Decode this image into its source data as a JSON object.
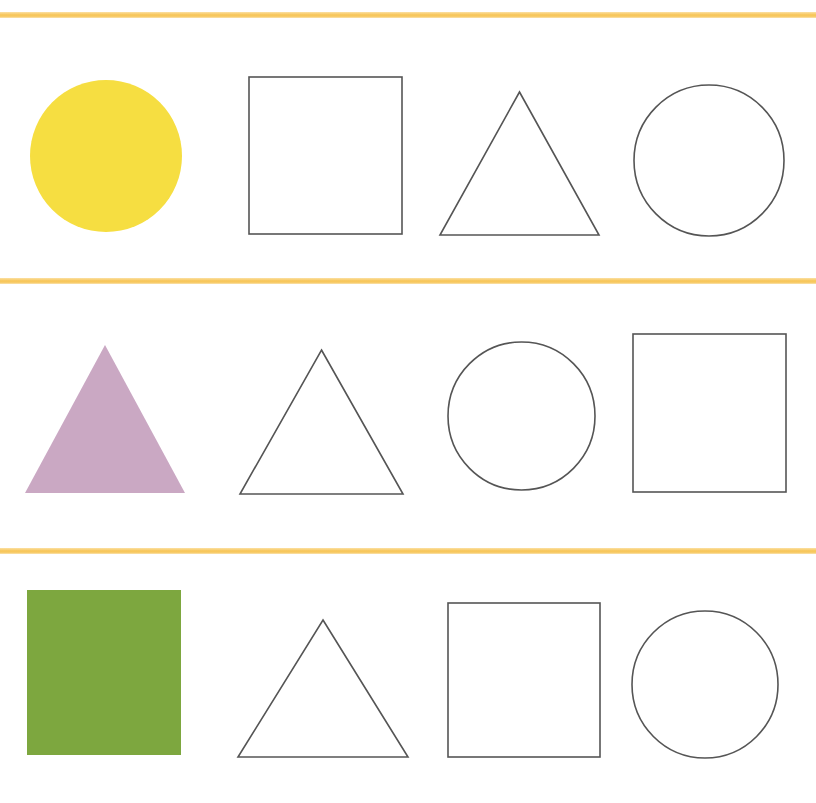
{
  "worksheet": {
    "title": "Shape Pattern Worksheet",
    "background_color": "#ffffff",
    "width": 816,
    "height": 803,
    "divider_color": "#F7C75C",
    "outline_color": "#555555",
    "outline_width": 1.6,
    "dividers": [
      {
        "name": "divider-top",
        "y": 12,
        "thickness": 6
      },
      {
        "name": "divider-middle",
        "y": 278,
        "thickness": 6
      },
      {
        "name": "divider-bottom",
        "y": 548,
        "thickness": 6
      }
    ],
    "rows": [
      {
        "id": "row-1",
        "label": "Row 1",
        "key_shape": "circle",
        "key_color": "#F7DE3C",
        "pattern_sequence": [
          "circle",
          "square",
          "triangle",
          "circle"
        ],
        "shapes": [
          {
            "name": "yellow-circle",
            "type": "circle",
            "fill": "#F7DE3C",
            "stroke": "none",
            "x": 30,
            "y": 80,
            "w": 152,
            "h": 152
          },
          {
            "name": "outline-square-1",
            "type": "square",
            "fill": "none",
            "stroke": "#555555",
            "x": 249,
            "y": 77,
            "w": 153,
            "h": 157
          },
          {
            "name": "outline-triangle-1",
            "type": "triangle",
            "fill": "none",
            "stroke": "#555555",
            "x": 440,
            "y": 92,
            "w": 159,
            "h": 143
          },
          {
            "name": "outline-circle-1",
            "type": "circle",
            "fill": "none",
            "stroke": "#555555",
            "x": 634,
            "y": 85,
            "w": 150,
            "h": 151
          }
        ]
      },
      {
        "id": "row-2",
        "label": "Row 2",
        "key_shape": "triangle",
        "key_color": "#CBA8C4",
        "pattern_sequence": [
          "triangle",
          "triangle",
          "circle",
          "square"
        ],
        "shapes": [
          {
            "name": "purple-triangle",
            "type": "triangle",
            "fill": "#CBA8C4",
            "stroke": "none",
            "x": 25,
            "y": 345,
            "w": 160,
            "h": 148
          },
          {
            "name": "outline-triangle-2",
            "type": "triangle",
            "fill": "none",
            "stroke": "#555555",
            "x": 240,
            "y": 350,
            "w": 163,
            "h": 144
          },
          {
            "name": "outline-circle-2",
            "type": "circle",
            "fill": "none",
            "stroke": "#555555",
            "x": 448,
            "y": 342,
            "w": 147,
            "h": 148
          },
          {
            "name": "outline-square-2",
            "type": "square",
            "fill": "none",
            "stroke": "#555555",
            "x": 633,
            "y": 334,
            "w": 153,
            "h": 158
          }
        ]
      },
      {
        "id": "row-3",
        "label": "Row 3",
        "key_shape": "square",
        "key_color": "#7CA83C",
        "pattern_sequence": [
          "square",
          "triangle",
          "square",
          "circle"
        ],
        "shapes": [
          {
            "name": "green-square",
            "type": "square",
            "fill": "#7CA83C",
            "stroke": "none",
            "x": 27,
            "y": 590,
            "w": 154,
            "h": 165
          },
          {
            "name": "outline-triangle-3",
            "type": "triangle",
            "fill": "none",
            "stroke": "#555555",
            "x": 238,
            "y": 620,
            "w": 170,
            "h": 137
          },
          {
            "name": "outline-square-3",
            "type": "square",
            "fill": "none",
            "stroke": "#555555",
            "x": 448,
            "y": 603,
            "w": 152,
            "h": 154
          },
          {
            "name": "outline-circle-3",
            "type": "circle",
            "fill": "none",
            "stroke": "#555555",
            "x": 632,
            "y": 611,
            "w": 146,
            "h": 147
          }
        ]
      }
    ]
  }
}
